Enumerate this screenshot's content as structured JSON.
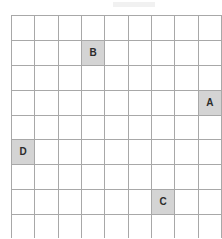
{
  "figure": {
    "type": "grid-puzzle",
    "title": "",
    "rows": 9,
    "cols": 9
  },
  "colors": {
    "page_background": "#ffffff",
    "cell_background": "#ffffff",
    "filled_cell_background": "#d4d4d4",
    "inner_gridline": "#a8a8a8",
    "outer_border": "#4a4a4a",
    "label_text": "#2b2b2b"
  },
  "grid": {
    "cells": [
      [
        "",
        "",
        "",
        "",
        "",
        "",
        "",
        "",
        ""
      ],
      [
        "",
        "",
        "",
        "B",
        "",
        "",
        "",
        "",
        ""
      ],
      [
        "",
        "",
        "",
        "",
        "",
        "",
        "",
        "",
        ""
      ],
      [
        "",
        "",
        "",
        "",
        "",
        "",
        "",
        "",
        "A"
      ],
      [
        "",
        "",
        "",
        "",
        "",
        "",
        "",
        "",
        ""
      ],
      [
        "D",
        "",
        "",
        "",
        "",
        "",
        "",
        "",
        ""
      ],
      [
        "",
        "",
        "",
        "",
        "",
        "",
        "",
        "",
        ""
      ],
      [
        "",
        "",
        "",
        "",
        "",
        "",
        "C",
        "",
        ""
      ],
      [
        "",
        "",
        "",
        "",
        "",
        "",
        "",
        "",
        ""
      ]
    ]
  },
  "labels": [
    {
      "label": "A",
      "row": 4,
      "col": 9
    },
    {
      "label": "B",
      "row": 2,
      "col": 4
    },
    {
      "label": "C",
      "row": 8,
      "col": 7
    },
    {
      "label": "D",
      "row": 6,
      "col": 1
    }
  ]
}
